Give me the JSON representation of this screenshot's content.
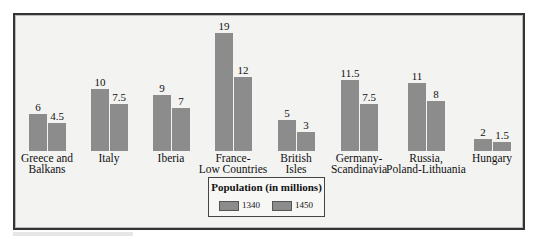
{
  "chart_data": {
    "type": "bar",
    "title": "Population (in millions)",
    "categories": [
      "Greece and Balkans",
      "Italy",
      "Iberia",
      "France-Low Countries",
      "British Isles",
      "Germany-Scandinavia",
      "Russia, Poland-Lithuania",
      "Hungary"
    ],
    "category_lines": [
      [
        "Greece and",
        "Balkans"
      ],
      [
        "Italy",
        ""
      ],
      [
        "Iberia",
        ""
      ],
      [
        "France-",
        "Low Countries"
      ],
      [
        "British",
        "Isles"
      ],
      [
        "Germany-",
        "Scandinavia"
      ],
      [
        "Russia,",
        "Poland-Lithuania"
      ],
      [
        "Hungary",
        ""
      ]
    ],
    "series": [
      {
        "name": "1340",
        "values": [
          6,
          10,
          9,
          19,
          5,
          11.5,
          11,
          2
        ]
      },
      {
        "name": "1450",
        "values": [
          4.5,
          7.5,
          7,
          12,
          3,
          7.5,
          8,
          1.5
        ]
      }
    ],
    "value_labels": [
      [
        "6",
        "4.5"
      ],
      [
        "10",
        "7.5"
      ],
      [
        "9",
        "7"
      ],
      [
        "19",
        "12"
      ],
      [
        "5",
        "3"
      ],
      [
        "11.5",
        "7.5"
      ],
      [
        "11",
        "8"
      ],
      [
        "2",
        "1.5"
      ]
    ],
    "xlabel": "",
    "ylabel": "",
    "grid": false,
    "legend_position": "bottom-center",
    "colors": {
      "bar": "#8c8c8c",
      "background": "#f3f3f2"
    }
  },
  "legend": {
    "title": "Population (in millions)",
    "items": [
      "1340",
      "1450"
    ]
  }
}
